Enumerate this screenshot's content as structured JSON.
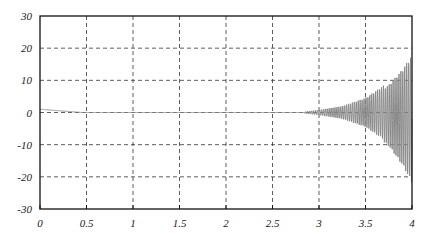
{
  "chart_data": {
    "type": "line",
    "title": "",
    "xlabel": "",
    "ylabel": "",
    "xlim": [
      0,
      4
    ],
    "ylim": [
      -30,
      30
    ],
    "grid": true,
    "legend": null,
    "x_ticks": [
      "0",
      "0.5",
      "1",
      "1.5",
      "2",
      "2.5",
      "3",
      "3.5",
      "4"
    ],
    "y_ticks": [
      "30",
      "20",
      "10",
      "0",
      "-10",
      "-20",
      "-30"
    ],
    "line_color": "#8a8a8a",
    "series": [
      {
        "name": "signal",
        "description": "Initial value ~1 decaying to 0 by t≈0.45; flat near 0 until t≈2.85; then a rapidly oscillating signal with exponentially growing envelope reaching about +18 / -22 at t=4",
        "envelope_points": [
          {
            "t": 0.0,
            "amp": 1.0
          },
          {
            "t": 0.45,
            "amp": 0.0
          },
          {
            "t": 2.85,
            "amp": 0.3
          },
          {
            "t": 3.0,
            "amp": 0.8
          },
          {
            "t": 3.25,
            "amp": 2.0
          },
          {
            "t": 3.5,
            "amp": 4.5
          },
          {
            "t": 3.75,
            "amp": 9.5
          },
          {
            "t": 3.9,
            "amp": 15.0
          },
          {
            "t": 4.0,
            "amp": 20.0
          }
        ]
      }
    ]
  }
}
